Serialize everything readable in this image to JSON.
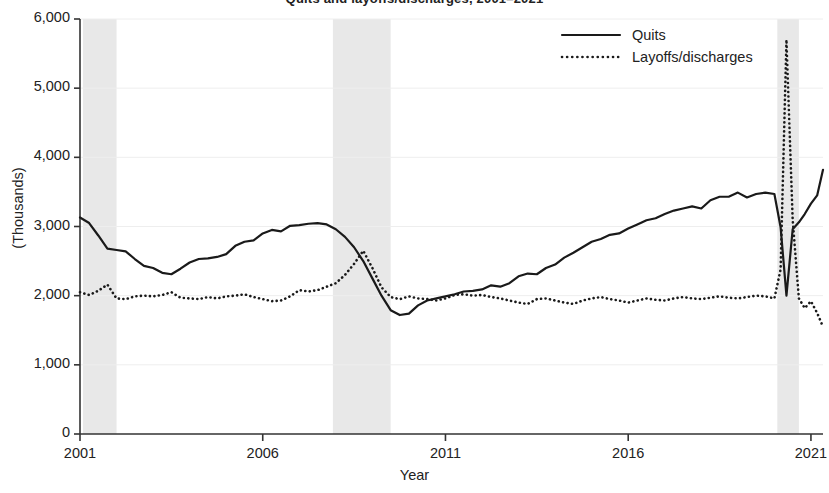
{
  "chart_data": {
    "type": "line",
    "title": "Quits and layoffs/discharges, 2001–2021",
    "xlabel": "Year",
    "ylabel": "(Thousands)",
    "ylim": [
      0,
      6000
    ],
    "xlim": [
      2001,
      2021.33
    ],
    "grid": true,
    "legend_position": "top-right",
    "ytick_labels": [
      "6,000",
      "5,000",
      "4,000",
      "3,000",
      "2,000",
      "1,000",
      "0"
    ],
    "ytick_values": [
      6000,
      5000,
      4000,
      3000,
      2000,
      1000,
      0
    ],
    "xtick_labels": [
      "2001",
      "2006",
      "2011",
      "2016",
      "2021"
    ],
    "xtick_values": [
      2001,
      2006,
      2011,
      2016,
      2021
    ],
    "shaded_regions": [
      {
        "label": "recession-2001",
        "start": 2001.08,
        "end": 2002.0
      },
      {
        "label": "recession-2008",
        "start": 2007.92,
        "end": 2009.5
      },
      {
        "label": "recession-2020",
        "start": 2020.08,
        "end": 2020.67
      }
    ],
    "shade_color": "#e8e8e8",
    "series": [
      {
        "name": "Quits",
        "style": "solid",
        "color": "#1a1a1a",
        "x": [
          2001.0,
          2001.25,
          2001.5,
          2001.75,
          2002.0,
          2002.25,
          2002.5,
          2002.75,
          2003.0,
          2003.25,
          2003.5,
          2003.75,
          2004.0,
          2004.25,
          2004.5,
          2004.75,
          2005.0,
          2005.25,
          2005.5,
          2005.75,
          2006.0,
          2006.25,
          2006.5,
          2006.75,
          2007.0,
          2007.25,
          2007.5,
          2007.75,
          2008.0,
          2008.25,
          2008.5,
          2008.75,
          2009.0,
          2009.25,
          2009.5,
          2009.75,
          2010.0,
          2010.25,
          2010.5,
          2010.75,
          2011.0,
          2011.25,
          2011.5,
          2011.75,
          2012.0,
          2012.25,
          2012.5,
          2012.75,
          2013.0,
          2013.25,
          2013.5,
          2013.75,
          2014.0,
          2014.25,
          2014.5,
          2014.75,
          2015.0,
          2015.25,
          2015.5,
          2015.75,
          2016.0,
          2016.25,
          2016.5,
          2016.75,
          2017.0,
          2017.25,
          2017.5,
          2017.75,
          2018.0,
          2018.25,
          2018.5,
          2018.75,
          2019.0,
          2019.25,
          2019.5,
          2019.75,
          2020.0,
          2020.17,
          2020.33,
          2020.5,
          2020.67,
          2020.83,
          2021.0,
          2021.17,
          2021.33
        ],
        "values": [
          3130,
          3050,
          2870,
          2680,
          2660,
          2640,
          2530,
          2430,
          2400,
          2330,
          2310,
          2390,
          2480,
          2530,
          2540,
          2560,
          2600,
          2720,
          2780,
          2800,
          2900,
          2950,
          2930,
          3010,
          3020,
          3040,
          3050,
          3030,
          2960,
          2850,
          2700,
          2500,
          2250,
          2000,
          1790,
          1720,
          1740,
          1860,
          1930,
          1960,
          1990,
          2020,
          2060,
          2070,
          2090,
          2150,
          2130,
          2180,
          2280,
          2320,
          2310,
          2400,
          2450,
          2550,
          2620,
          2700,
          2780,
          2820,
          2880,
          2900,
          2970,
          3030,
          3090,
          3120,
          3180,
          3230,
          3260,
          3290,
          3260,
          3380,
          3430,
          3430,
          3490,
          3420,
          3470,
          3490,
          3470,
          2990,
          2000,
          2960,
          3060,
          3180,
          3330,
          3450,
          3820
        ]
      },
      {
        "name": "Layoffs/discharges",
        "style": "dotted",
        "color": "#1a1a1a",
        "x": [
          2001.0,
          2001.25,
          2001.5,
          2001.75,
          2002.0,
          2002.25,
          2002.5,
          2002.75,
          2003.0,
          2003.25,
          2003.5,
          2003.75,
          2004.0,
          2004.25,
          2004.5,
          2004.75,
          2005.0,
          2005.25,
          2005.5,
          2005.75,
          2006.0,
          2006.25,
          2006.5,
          2006.75,
          2007.0,
          2007.25,
          2007.5,
          2007.75,
          2008.0,
          2008.25,
          2008.5,
          2008.75,
          2009.0,
          2009.25,
          2009.5,
          2009.75,
          2010.0,
          2010.25,
          2010.5,
          2010.75,
          2011.0,
          2011.25,
          2011.5,
          2011.75,
          2012.0,
          2012.25,
          2012.5,
          2012.75,
          2013.0,
          2013.25,
          2013.5,
          2013.75,
          2014.0,
          2014.25,
          2014.5,
          2014.75,
          2015.0,
          2015.25,
          2015.5,
          2015.75,
          2016.0,
          2016.25,
          2016.5,
          2016.75,
          2017.0,
          2017.25,
          2017.5,
          2017.75,
          2018.0,
          2018.25,
          2018.5,
          2018.75,
          2019.0,
          2019.25,
          2019.5,
          2019.75,
          2020.0,
          2020.17,
          2020.33,
          2020.5,
          2020.67,
          2020.83,
          2021.0,
          2021.17,
          2021.33
        ],
        "values": [
          2050,
          2010,
          2070,
          2160,
          1960,
          1950,
          1990,
          2000,
          1990,
          2010,
          2050,
          1970,
          1960,
          1950,
          1980,
          1960,
          1990,
          2000,
          2020,
          1980,
          1950,
          1920,
          1930,
          1990,
          2080,
          2060,
          2080,
          2130,
          2180,
          2300,
          2460,
          2650,
          2400,
          2120,
          1980,
          1950,
          1990,
          1960,
          1950,
          1930,
          1960,
          2010,
          2020,
          2000,
          2010,
          1980,
          1960,
          1930,
          1900,
          1880,
          1950,
          1960,
          1930,
          1900,
          1880,
          1930,
          1960,
          1980,
          1950,
          1930,
          1900,
          1930,
          1960,
          1940,
          1930,
          1960,
          1980,
          1960,
          1950,
          1970,
          1990,
          1970,
          1960,
          1980,
          2000,
          1990,
          1960,
          2380,
          5700,
          3100,
          1960,
          1820,
          1920,
          1750,
          1550
        ]
      }
    ]
  },
  "axes": {
    "y_axis_title": "(Thousands)",
    "x_axis_title": "Year"
  },
  "legend": {
    "items": [
      {
        "label": "Quits",
        "style": "solid"
      },
      {
        "label": "Layoffs/discharges",
        "style": "dotted"
      }
    ]
  }
}
